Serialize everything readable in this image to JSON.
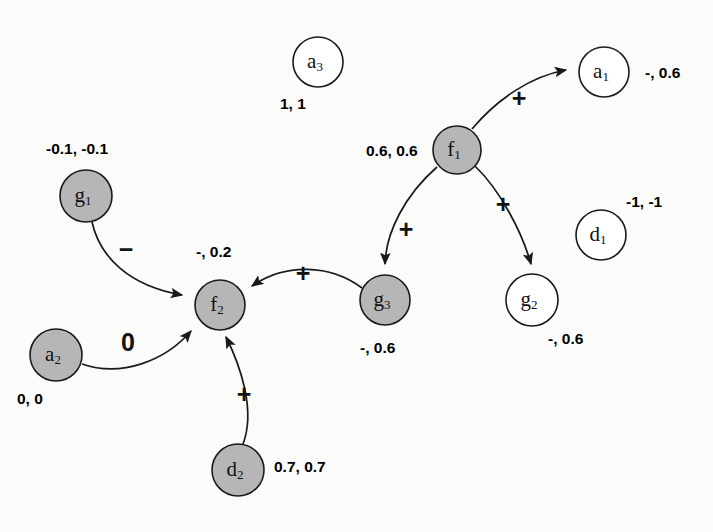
{
  "figure": {
    "type": "directed-graph-diagram",
    "background_color": "#fbfbfa",
    "node_fill_gray": "#b6b6b6",
    "node_fill_white": "#ffffff",
    "stroke_color": "#1a1a1a"
  },
  "nodes": [
    {
      "id": "a3",
      "base": "a",
      "sub": "3",
      "fill": "white",
      "cx": 318,
      "cy": 62,
      "r": 25,
      "value_text": "1, 1",
      "value_x": 280,
      "value_y": 95
    },
    {
      "id": "a1",
      "base": "a",
      "sub": "1",
      "fill": "white",
      "cx": 604,
      "cy": 72,
      "r": 25,
      "value_text": "-, 0.6",
      "value_x": 645,
      "value_y": 64
    },
    {
      "id": "f1",
      "base": "f",
      "sub": "1",
      "fill": "gray",
      "cx": 457,
      "cy": 150,
      "r": 24,
      "value_text": "0.6, 0.6",
      "value_x": 366,
      "value_y": 142
    },
    {
      "id": "g1",
      "base": "g",
      "sub": "1",
      "fill": "gray",
      "cx": 86,
      "cy": 196,
      "r": 26,
      "value_text": "-0.1, -0.1",
      "value_x": 46,
      "value_y": 140
    },
    {
      "id": "d1",
      "base": "d",
      "sub": "1",
      "fill": "white",
      "cx": 601,
      "cy": 235,
      "r": 25,
      "value_text": "-1, -1",
      "value_x": 626,
      "value_y": 193
    },
    {
      "id": "f2",
      "base": "f",
      "sub": "2",
      "fill": "gray",
      "cx": 220,
      "cy": 305,
      "r": 25,
      "value_text": "-, 0.2",
      "value_x": 196,
      "value_y": 243
    },
    {
      "id": "g3",
      "base": "g",
      "sub": "3",
      "fill": "gray",
      "cx": 385,
      "cy": 300,
      "r": 25,
      "value_text": "-, 0.6",
      "value_x": 360,
      "value_y": 339
    },
    {
      "id": "g2",
      "base": "g",
      "sub": "2",
      "fill": "white",
      "cx": 532,
      "cy": 300,
      "r": 26,
      "value_text": "-, 0.6",
      "value_x": 548,
      "value_y": 330
    },
    {
      "id": "a2",
      "base": "a",
      "sub": "2",
      "fill": "gray",
      "cx": 56,
      "cy": 355,
      "r": 26,
      "value_text": "0, 0",
      "value_x": 17,
      "value_y": 390
    },
    {
      "id": "d2",
      "base": "d",
      "sub": "2",
      "fill": "gray",
      "cx": 238,
      "cy": 470,
      "r": 26,
      "value_text": "0.7, 0.7",
      "value_x": 274,
      "value_y": 458
    }
  ],
  "edges": [
    {
      "id": "f1-a1",
      "from": "f1",
      "to": "a1",
      "sign": "+",
      "sign_x": 519,
      "sign_y": 100,
      "path": "M 472 129 C 498 98, 532 76, 566 70"
    },
    {
      "id": "f1-g3",
      "from": "f1",
      "to": "g3",
      "sign": "+",
      "sign_x": 406,
      "sign_y": 231,
      "path": "M 437 167 C 405 195, 386 232, 385 264"
    },
    {
      "id": "f1-g2",
      "from": "f1",
      "to": "g2",
      "sign": "+",
      "sign_x": 503,
      "sign_y": 206,
      "path": "M 475 166 C 500 190, 522 232, 531 264"
    },
    {
      "id": "g3-f2",
      "from": "g3",
      "to": "f2",
      "sign": "+",
      "sign_x": 303,
      "sign_y": 275,
      "path": "M 362 288 C 330 264, 285 263, 252 286"
    },
    {
      "id": "g1-f2",
      "from": "g1",
      "to": "f2",
      "sign": "−",
      "sign_x": 126,
      "sign_y": 251,
      "path": "M 92 222 C 100 258, 130 286, 182 295"
    },
    {
      "id": "a2-f2",
      "from": "a2",
      "to": "f2",
      "sign": "0",
      "sign_x": 128,
      "sign_y": 344,
      "path": "M 82 364 C 122 378, 166 360, 191 331"
    },
    {
      "id": "d2-f2",
      "from": "d2",
      "to": "f2",
      "sign": "+",
      "sign_x": 244,
      "sign_y": 396,
      "path": "M 243 444 C 256 410, 240 365, 226 337"
    }
  ]
}
